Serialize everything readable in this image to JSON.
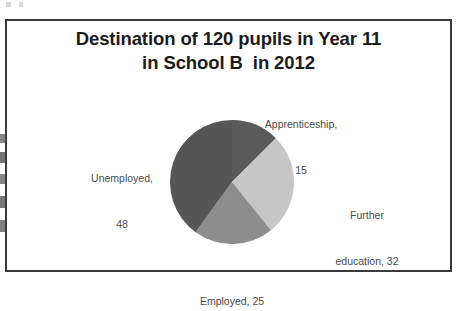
{
  "chart_data": {
    "type": "pie",
    "title": "Destination of 120 pupils in Year 11 in School B  in 2012",
    "title_lines": [
      "Destination of 120 pupils in Year 11",
      "in School B  in 2012"
    ],
    "total": 120,
    "categories": [
      "Apprenticeship",
      "Further education",
      "Employed",
      "Unemployed"
    ],
    "values": [
      15,
      32,
      25,
      48
    ],
    "labels": [
      {
        "name": "Apprenticeship",
        "value": 15,
        "lines": [
          "Apprenticeship,",
          "15"
        ],
        "color": "#5a5a5a",
        "start_angle": 0,
        "sweep_angle": 45
      },
      {
        "name": "Further education",
        "value": 32,
        "lines": [
          "Further",
          "education, 32"
        ],
        "color": "#c6c6c6",
        "start_angle": 45,
        "sweep_angle": 96
      },
      {
        "name": "Employed",
        "value": 25,
        "lines": [
          "Employed, 25"
        ],
        "color": "#8d8d8d",
        "start_angle": 141,
        "sweep_angle": 75
      },
      {
        "name": "Unemployed",
        "value": 48,
        "lines": [
          "Unemployed,",
          "48"
        ],
        "color": "#565656",
        "start_angle": 216,
        "sweep_angle": 144
      }
    ],
    "legend": "none",
    "grid": false,
    "xlabel": "",
    "ylabel": "",
    "start_angle_deg": 0,
    "direction": "clockwise",
    "frame_color": "#3a3a3a",
    "background_color": "#ffffff",
    "label_text_color": "#4a4a4a",
    "title_text_color": "#1b1b1b"
  }
}
